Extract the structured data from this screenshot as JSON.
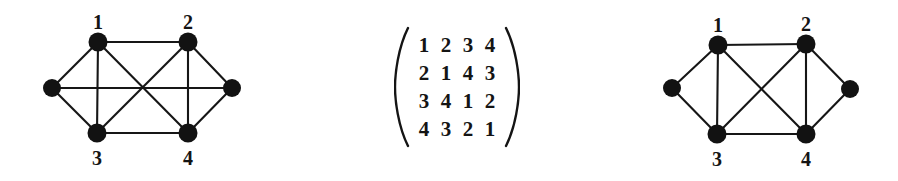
{
  "figure": {
    "background_color": "#ffffff",
    "ink_color": "#141414",
    "width": 898,
    "height": 181
  },
  "left_graph": {
    "name": "left-graph",
    "caption": "",
    "vertex_radius": 9.5,
    "side_vertex_radius": 9.0,
    "nodes": [
      {
        "id": "n1",
        "label": "1",
        "x": 98,
        "y": 42,
        "label_x": 87,
        "label_y": 12,
        "labeled": true
      },
      {
        "id": "n2",
        "label": "2",
        "x": 188,
        "y": 42,
        "label_x": 177,
        "label_y": 12,
        "labeled": true
      },
      {
        "id": "n3",
        "label": "3",
        "x": 97,
        "y": 133,
        "label_x": 86,
        "label_y": 148,
        "labeled": true
      },
      {
        "id": "n4",
        "label": "4",
        "x": 188,
        "y": 133,
        "label_x": 177,
        "label_y": 148,
        "labeled": true
      },
      {
        "id": "nL",
        "label": "",
        "x": 52,
        "y": 88,
        "labeled": false
      },
      {
        "id": "nR",
        "label": "",
        "x": 232,
        "y": 88,
        "labeled": false
      }
    ],
    "edges": [
      {
        "from": "n1",
        "to": "n2"
      },
      {
        "from": "n3",
        "to": "n4"
      },
      {
        "from": "n1",
        "to": "n3"
      },
      {
        "from": "n2",
        "to": "n4"
      },
      {
        "from": "n1",
        "to": "n4"
      },
      {
        "from": "n2",
        "to": "n3"
      },
      {
        "from": "nL",
        "to": "n1"
      },
      {
        "from": "nL",
        "to": "n3"
      },
      {
        "from": "nR",
        "to": "n2"
      },
      {
        "from": "nR",
        "to": "n4"
      },
      {
        "from": "nL",
        "to": "nR"
      }
    ]
  },
  "matrix": {
    "name": "cayley-table-matrix",
    "left_bracket": "(",
    "right_bracket": ")",
    "rows": [
      [
        "1",
        "2",
        "3",
        "4"
      ],
      [
        "2",
        "1",
        "4",
        "3"
      ],
      [
        "3",
        "4",
        "1",
        "2"
      ],
      [
        "4",
        "3",
        "2",
        "1"
      ]
    ]
  },
  "right_graph": {
    "name": "right-graph",
    "caption": "",
    "vertex_radius": 9.5,
    "side_vertex_radius": 9.0,
    "nodes": [
      {
        "id": "n1",
        "label": "1",
        "x": 98,
        "y": 45,
        "label_x": 87,
        "label_y": 15,
        "labeled": true
      },
      {
        "id": "n2",
        "label": "2",
        "x": 186,
        "y": 44,
        "label_x": 175,
        "label_y": 14,
        "labeled": true
      },
      {
        "id": "n3",
        "label": "3",
        "x": 97,
        "y": 134,
        "label_x": 86,
        "label_y": 149,
        "labeled": true
      },
      {
        "id": "n4",
        "label": "4",
        "x": 186,
        "y": 134,
        "label_x": 175,
        "label_y": 149,
        "labeled": true
      },
      {
        "id": "nL",
        "label": "",
        "x": 52,
        "y": 88,
        "labeled": false
      },
      {
        "id": "nR",
        "label": "",
        "x": 230,
        "y": 89,
        "labeled": false
      }
    ],
    "edges": [
      {
        "from": "n1",
        "to": "n2"
      },
      {
        "from": "n3",
        "to": "n4"
      },
      {
        "from": "n1",
        "to": "n3"
      },
      {
        "from": "n2",
        "to": "n4"
      },
      {
        "from": "n1",
        "to": "n4"
      },
      {
        "from": "n2",
        "to": "n3"
      },
      {
        "from": "nL",
        "to": "n1"
      },
      {
        "from": "nL",
        "to": "n3"
      },
      {
        "from": "nR",
        "to": "n2"
      },
      {
        "from": "nR",
        "to": "n4"
      }
    ]
  }
}
